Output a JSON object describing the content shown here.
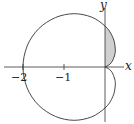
{
  "diagram": {
    "type": "polar-curve",
    "equation_hint": "r = 1 - cos(theta) (cardioid)",
    "axes": {
      "x_label": "x",
      "y_label": "y",
      "x_ticks": [
        {
          "value": -2,
          "label": "−2"
        },
        {
          "value": -1,
          "label": "−1"
        }
      ]
    },
    "shaded_region": {
      "description": "Region between y-axis and cardioid in first quadrant",
      "fill": "#d0d0d0"
    },
    "colors": {
      "curve": "#333333",
      "axes": "#333333",
      "shade": "#d0d0d0"
    }
  }
}
